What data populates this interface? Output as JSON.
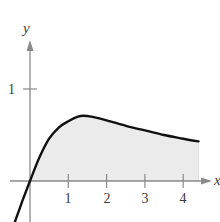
{
  "chart_data": {
    "type": "area",
    "title": "",
    "xlabel": "x",
    "ylabel": "y",
    "x_ticks": [
      "1",
      "2",
      "3",
      "4"
    ],
    "y_ticks": [
      "1"
    ],
    "xlim": [
      -0.7,
      4.8
    ],
    "ylim": [
      -0.45,
      1.5
    ],
    "grid": false,
    "legend": null,
    "shaded_region": {
      "x_from": 0,
      "x_to": 4.4,
      "between": "curve and x-axis",
      "color": "#ebebeb"
    },
    "series": [
      {
        "name": "f(x)",
        "color": "#111111",
        "x": [
          -0.4,
          -0.2,
          0,
          0.25,
          0.5,
          0.75,
          1.0,
          1.25,
          1.4,
          1.6,
          2.0,
          2.5,
          3.0,
          3.5,
          4.0,
          4.4
        ],
        "y": [
          -0.45,
          -0.22,
          0.0,
          0.26,
          0.46,
          0.58,
          0.65,
          0.7,
          0.71,
          0.7,
          0.66,
          0.6,
          0.55,
          0.5,
          0.46,
          0.43
        ]
      }
    ]
  },
  "axes": {
    "x_label": "x",
    "y_label": "y",
    "x_tick_labels": [
      "1",
      "2",
      "3",
      "4"
    ],
    "y_tick_labels": [
      "1"
    ]
  }
}
